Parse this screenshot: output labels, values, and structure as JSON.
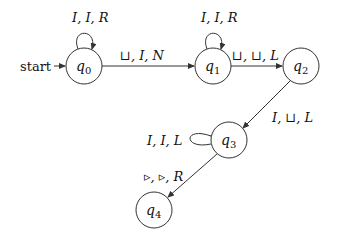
{
  "diagram": {
    "type": "turing-machine-state-diagram",
    "start_label": "start",
    "states": [
      {
        "id": "q0",
        "name": "q",
        "sub": "0",
        "x": 84,
        "y": 66
      },
      {
        "id": "q1",
        "name": "q",
        "sub": "1",
        "x": 213,
        "y": 66
      },
      {
        "id": "q2",
        "name": "q",
        "sub": "2",
        "x": 301,
        "y": 66
      },
      {
        "id": "q3",
        "name": "q",
        "sub": "3",
        "x": 229,
        "y": 140
      },
      {
        "id": "q4",
        "name": "q",
        "sub": "4",
        "x": 154,
        "y": 210
      }
    ],
    "transitions": [
      {
        "from": "q0",
        "to": "q0",
        "label": "I, I, R"
      },
      {
        "from": "q0",
        "to": "q1",
        "label": "⊔, I, N"
      },
      {
        "from": "q1",
        "to": "q1",
        "label": "I, I, R"
      },
      {
        "from": "q1",
        "to": "q2",
        "label": "⊔, ⊔, L"
      },
      {
        "from": "q2",
        "to": "q3",
        "label": "I, ⊔, L"
      },
      {
        "from": "q3",
        "to": "q3",
        "label": "I, I, L"
      },
      {
        "from": "q3",
        "to": "q4",
        "label": "▹, ▹, R"
      }
    ]
  }
}
